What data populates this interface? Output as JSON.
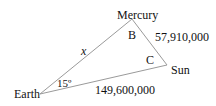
{
  "diagram": {
    "type": "triangle",
    "vertices": {
      "earth": {
        "label": "Earth"
      },
      "mercury": {
        "label": "Mercury"
      },
      "sun": {
        "label": "Sun"
      }
    },
    "angles": {
      "earth": "15º",
      "mercury": "B",
      "sun": "C"
    },
    "sides": {
      "earth_mercury": "x",
      "mercury_sun": "57,910,000",
      "earth_sun": "149,600,000"
    },
    "line_color": "#9a9a9a"
  }
}
